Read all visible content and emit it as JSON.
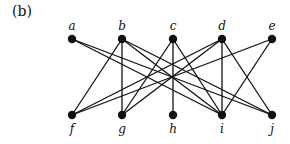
{
  "panel_label": "(b)",
  "nodes": [
    {
      "id": "a",
      "label": "a",
      "x": 72,
      "y": 39,
      "row": "top"
    },
    {
      "id": "b",
      "label": "b",
      "x": 122,
      "y": 39,
      "row": "top"
    },
    {
      "id": "c",
      "label": "c",
      "x": 173,
      "y": 39,
      "row": "top"
    },
    {
      "id": "d",
      "label": "d",
      "x": 222,
      "y": 39,
      "row": "top"
    },
    {
      "id": "e",
      "label": "e",
      "x": 272,
      "y": 39,
      "row": "top"
    },
    {
      "id": "f",
      "label": "f",
      "x": 72,
      "y": 115,
      "row": "bottom"
    },
    {
      "id": "g",
      "label": "g",
      "x": 122,
      "y": 115,
      "row": "bottom"
    },
    {
      "id": "h",
      "label": "h",
      "x": 173,
      "y": 115,
      "row": "bottom"
    },
    {
      "id": "i",
      "label": "i",
      "x": 222,
      "y": 115,
      "row": "bottom"
    },
    {
      "id": "j",
      "label": "j",
      "x": 272,
      "y": 115,
      "row": "bottom"
    }
  ],
  "edges": [
    [
      "a",
      "i"
    ],
    [
      "a",
      "j"
    ],
    [
      "b",
      "f"
    ],
    [
      "b",
      "g"
    ],
    [
      "b",
      "i"
    ],
    [
      "b",
      "j"
    ],
    [
      "c",
      "g"
    ],
    [
      "c",
      "h"
    ],
    [
      "c",
      "i"
    ],
    [
      "d",
      "f"
    ],
    [
      "d",
      "g"
    ],
    [
      "d",
      "i"
    ],
    [
      "d",
      "j"
    ],
    [
      "e",
      "f"
    ],
    [
      "e",
      "i"
    ]
  ],
  "colors": {
    "ink": "#111111",
    "background": "#ffffff"
  }
}
